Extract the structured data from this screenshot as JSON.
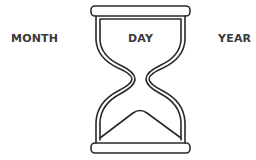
{
  "diagram": {
    "labels": {
      "month": "MONTH",
      "day": "DAY",
      "year": "YEAR"
    },
    "icon": "hourglass-icon",
    "colors": {
      "stroke": "#2a2a2a",
      "text": "#3a3a3a",
      "background": "#ffffff"
    }
  }
}
